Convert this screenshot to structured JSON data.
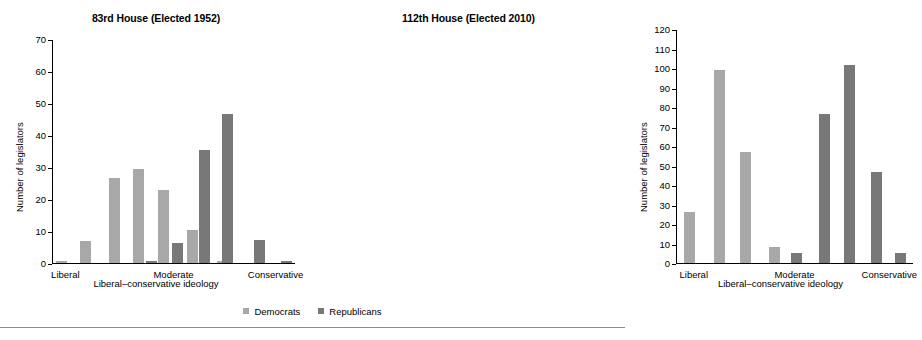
{
  "legend": {
    "items": [
      {
        "label": "Democrats",
        "color": "#a8a8a8",
        "key": "dem"
      },
      {
        "label": "Republicans",
        "color": "#787878",
        "key": "rep"
      }
    ]
  },
  "chart_data": [
    {
      "type": "bar",
      "panel": "left",
      "title": "83rd House (Elected 1952)",
      "xlabel": "Liberal–conservative ideology",
      "ylabel": "Number of legislators",
      "ylim": [
        0,
        70
      ],
      "yticks": [
        0,
        10,
        20,
        30,
        40,
        50,
        60,
        70
      ],
      "ytick_labels": [
        "0",
        "10",
        "20",
        "30",
        "40",
        "50",
        "60",
        "70"
      ],
      "xtick_labels": [
        "Liberal",
        "Moderate",
        "Conservative"
      ],
      "xtick_positions": [
        0.055,
        0.5,
        0.92
      ],
      "grid": false,
      "legend_position": "bottom-center",
      "bars": [
        {
          "series": "Democrats",
          "x": 0.035,
          "value": 0.7
        },
        {
          "series": "Democrats",
          "x": 0.135,
          "value": 7.0
        },
        {
          "series": "Democrats",
          "x": 0.255,
          "value": 26.7
        },
        {
          "series": "Democrats",
          "x": 0.355,
          "value": 29.6
        },
        {
          "series": "Republicans",
          "x": 0.405,
          "value": 0.7
        },
        {
          "series": "Democrats",
          "x": 0.455,
          "value": 22.8
        },
        {
          "series": "Republicans",
          "x": 0.515,
          "value": 6.3
        },
        {
          "series": "Democrats",
          "x": 0.575,
          "value": 10.3
        },
        {
          "series": "Republicans",
          "x": 0.625,
          "value": 35.4
        },
        {
          "series": "Democrats",
          "x": 0.7,
          "value": 0.5
        },
        {
          "series": "Republicans",
          "x": 0.72,
          "value": 46.7
        },
        {
          "series": "Republicans",
          "x": 0.855,
          "value": 7.2
        },
        {
          "series": "Republicans",
          "x": 0.965,
          "value": 0.5
        }
      ]
    },
    {
      "type": "bar",
      "panel": "right",
      "title": "112th House (Elected 2010)",
      "xlabel": "Liberal–conservative ideology",
      "ylabel": "Number of legislators",
      "ylim": [
        0,
        120
      ],
      "yticks": [
        0,
        10,
        20,
        30,
        40,
        50,
        60,
        70,
        80,
        90,
        100,
        110,
        120
      ],
      "ytick_labels": [
        "0",
        "10",
        "20",
        "30",
        "40",
        "50",
        "60",
        "70",
        "80",
        "90",
        "100",
        "110",
        "120"
      ],
      "xtick_labels": [
        "Liberal",
        "Moderate",
        "Conservative"
      ],
      "xtick_positions": [
        0.075,
        0.5,
        0.9
      ],
      "grid": false,
      "legend_position": "bottom-center",
      "bars": [
        {
          "series": "Democrats",
          "x": 0.055,
          "value": 26.5
        },
        {
          "series": "Democrats",
          "x": 0.18,
          "value": 99.5
        },
        {
          "series": "Democrats",
          "x": 0.29,
          "value": 57.2
        },
        {
          "series": "Democrats",
          "x": 0.415,
          "value": 8.3
        },
        {
          "series": "Republicans",
          "x": 0.505,
          "value": 5.2
        },
        {
          "series": "Republicans",
          "x": 0.625,
          "value": 77.0
        },
        {
          "series": "Republicans",
          "x": 0.73,
          "value": 102.0
        },
        {
          "series": "Republicans",
          "x": 0.845,
          "value": 47.0
        },
        {
          "series": "Republicans",
          "x": 0.945,
          "value": 5.0
        }
      ]
    }
  ]
}
